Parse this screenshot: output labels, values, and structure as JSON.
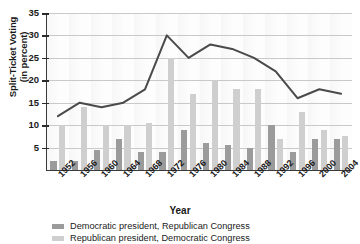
{
  "chart_data": {
    "type": "bar",
    "title": "",
    "xlabel": "Year",
    "ylabel": "Split-Ticket Voting (in percent)",
    "ylim": [
      0,
      35
    ],
    "ytick_step": 5,
    "yticks": [
      0,
      5,
      10,
      15,
      20,
      25,
      30,
      35
    ],
    "grid": true,
    "legend_position": "bottom-left",
    "categories": [
      "1952",
      "1956",
      "1960",
      "1964",
      "1968",
      "1972",
      "1976",
      "1980",
      "1984",
      "1988",
      "1992",
      "1996",
      "2000",
      "2004"
    ],
    "series": [
      {
        "name": "Democratic president, Republican Congress",
        "type": "bar",
        "color": "#9b9b9b",
        "values": [
          2,
          2,
          4.5,
          7,
          4,
          4,
          9,
          6,
          5.5,
          5,
          10,
          4,
          7,
          7
        ]
      },
      {
        "name": "Republican president, Democratic Congress",
        "type": "bar",
        "color": "#cfcfcf",
        "values": [
          10,
          14,
          10,
          10,
          10.5,
          25,
          17,
          20,
          18,
          18,
          7,
          13,
          9,
          7.5
        ]
      },
      {
        "name": "Split-ticket voting total",
        "type": "line",
        "color": "#4a4a4a",
        "values": [
          12,
          15,
          14,
          15,
          18,
          30,
          25,
          28,
          27,
          25,
          22,
          16,
          18,
          17
        ]
      }
    ]
  },
  "axis": {
    "x_title": "Year",
    "y_title_line1": "Split-Ticket Voting",
    "y_title_line2": "(in percent)"
  },
  "legend": {
    "items": [
      {
        "label": "Democratic president, Republican Congress",
        "color": "#9b9b9b"
      },
      {
        "label": "Republican president, Democratic Congress",
        "color": "#cfcfcf"
      }
    ]
  }
}
